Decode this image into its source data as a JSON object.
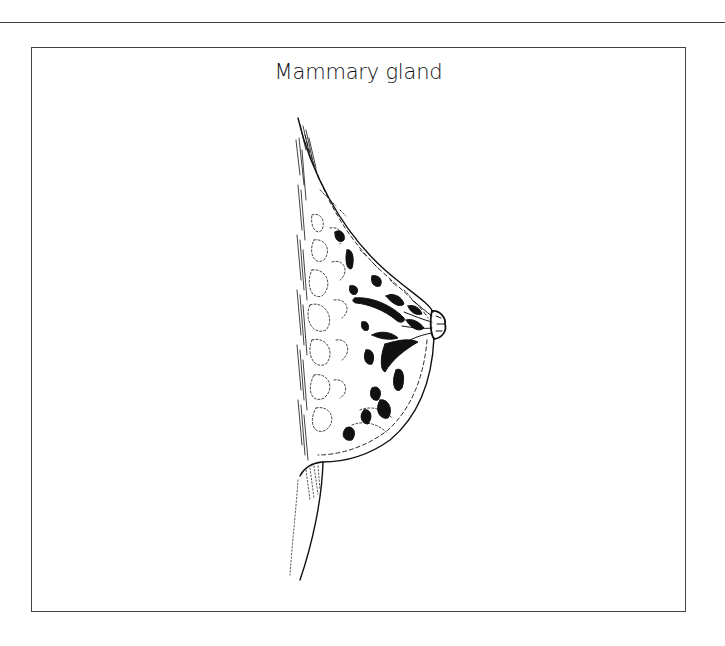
{
  "page": {
    "figure": {
      "title": "Mammary gland",
      "illustration": {
        "subject": "mammary-gland-sagittal-section",
        "style": "pen-and-ink line drawing",
        "colors": {
          "ink": "#111111",
          "frame": "#444444",
          "rule": "#3a3a3a",
          "background": "#ffffff"
        }
      }
    }
  }
}
